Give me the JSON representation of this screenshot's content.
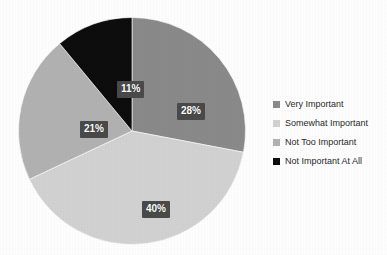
{
  "chart_data": {
    "type": "pie",
    "title": "",
    "subtitle": "",
    "categories": [
      "Very Important",
      "Somewhat Important",
      "Not Too Important",
      "Not Important At All"
    ],
    "values": [
      28,
      40,
      21,
      11
    ],
    "value_labels": [
      "28%",
      "40%",
      "21%",
      "11%"
    ],
    "unit": "%",
    "start_angle_deg": 0,
    "direction": "clockwise",
    "legend_position": "right",
    "grid": false,
    "colors": [
      "#8a8a8a",
      "#d2d2d2",
      "#b2b2b2",
      "#0d0d0d"
    ],
    "label_box_color": "#4a4a4a",
    "label_text_color": "#ffffff",
    "background_color": "#fefefe",
    "slices": [
      {
        "label": "Very Important",
        "value": 28,
        "display": "28%",
        "color": "#8a8a8a"
      },
      {
        "label": "Somewhat Important",
        "value": 40,
        "display": "40%",
        "color": "#d2d2d2"
      },
      {
        "label": "Not Too Important",
        "value": 21,
        "display": "21%",
        "color": "#b2b2b2"
      },
      {
        "label": "Not Important At All",
        "value": 11,
        "display": "11%",
        "color": "#0d0d0d"
      }
    ]
  },
  "legend": {
    "items": [
      {
        "label": "Very Important",
        "color": "#8a8a8a"
      },
      {
        "label": "Somewhat Important",
        "color": "#d2d2d2"
      },
      {
        "label": "Not Too Important",
        "color": "#b2b2b2"
      },
      {
        "label": "Not Important At All",
        "color": "#0d0d0d"
      }
    ]
  }
}
